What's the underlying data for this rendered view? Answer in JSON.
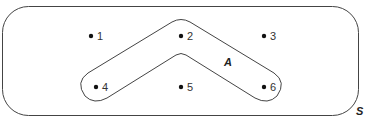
{
  "diagram": {
    "type": "venn",
    "universal_set": {
      "label": "S"
    },
    "subset": {
      "label": "A",
      "members": [
        "2",
        "4",
        "6"
      ]
    },
    "points": [
      {
        "label": "1",
        "x": 96,
        "y": 36
      },
      {
        "label": "2",
        "x": 181,
        "y": 36
      },
      {
        "label": "3",
        "x": 265,
        "y": 36
      },
      {
        "label": "4",
        "x": 96,
        "y": 87
      },
      {
        "label": "5",
        "x": 181,
        "y": 87
      },
      {
        "label": "6",
        "x": 265,
        "y": 87
      }
    ],
    "colors": {
      "stroke": "#333333",
      "point": "#111111",
      "background": "#ffffff"
    }
  }
}
